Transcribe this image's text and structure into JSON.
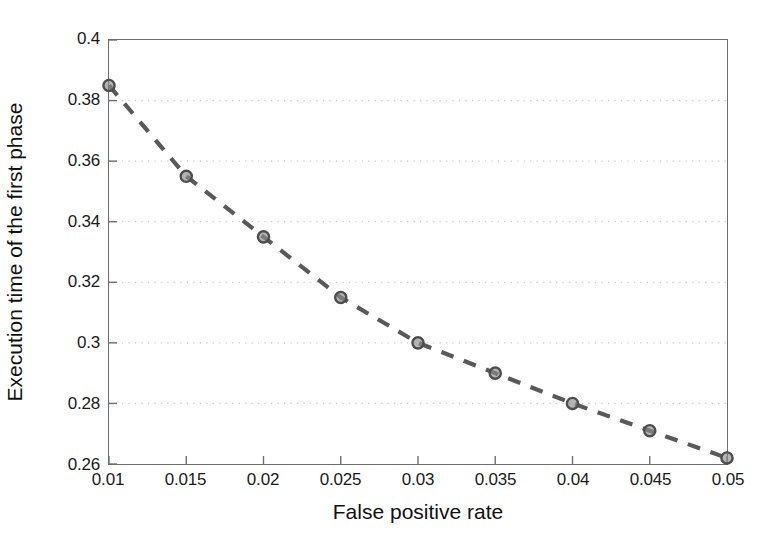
{
  "chart_data": {
    "type": "line",
    "title": "",
    "xlabel": "False positive rate",
    "ylabel": "Execution time of the first phase",
    "x": [
      0.01,
      0.015,
      0.02,
      0.025,
      0.03,
      0.035,
      0.04,
      0.045,
      0.05
    ],
    "values": [
      0.385,
      0.355,
      0.335,
      0.315,
      0.3,
      0.29,
      0.28,
      0.271,
      0.262
    ],
    "series": [
      {
        "name": "Execution time of the first phase",
        "values": [
          0.385,
          0.355,
          0.335,
          0.315,
          0.3,
          0.29,
          0.28,
          0.271,
          0.262
        ]
      }
    ],
    "xlim": [
      0.01,
      0.05
    ],
    "ylim": [
      0.26,
      0.4
    ],
    "xticks": [
      0.01,
      0.015,
      0.02,
      0.025,
      0.03,
      0.035,
      0.04,
      0.045,
      0.05
    ],
    "yticks": [
      0.26,
      0.28,
      0.3,
      0.32,
      0.34,
      0.36,
      0.38,
      0.4
    ],
    "xtick_labels": [
      "0.01",
      "0.015",
      "0.02",
      "0.025",
      "0.03",
      "0.035",
      "0.04",
      "0.045",
      "0.05"
    ],
    "ytick_labels": [
      "0.26",
      "0.28",
      "0.3",
      "0.32",
      "0.34",
      "0.36",
      "0.38",
      "0.4"
    ],
    "grid": true,
    "grid_style": "dotted",
    "grid_axis": "y",
    "legend": null,
    "legend_position": "none",
    "line_style": "dashed",
    "marker": "circle",
    "colors": {
      "line": "#595959",
      "marker_edge": "#4d4d4d",
      "marker_face": "#8c8c8c",
      "axis": "#6e6e6e",
      "grid": "#c8c8c8",
      "text": "#1a1a1a",
      "background": "#ffffff"
    }
  }
}
